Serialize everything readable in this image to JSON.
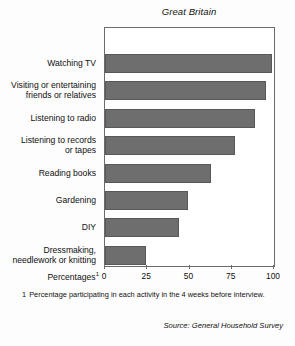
{
  "chart_data": {
    "type": "bar",
    "orientation": "horizontal",
    "title": "Great Britain",
    "xlabel": "Percentages",
    "xlabel_footnote_marker": "1",
    "ylabel": "",
    "categories": [
      "Watching TV",
      "Visiting or entertaining friends or relatives",
      "Listening to radio",
      "Listening to records or tapes",
      "Reading books",
      "Gardening",
      "DIY",
      "Dressmaking, needlework or knitting"
    ],
    "values": [
      99,
      95,
      89,
      77,
      63,
      49,
      44,
      24
    ],
    "xlim": [
      0,
      100
    ],
    "xticks": [
      0,
      25,
      50,
      75,
      100
    ],
    "xtick_labels": [
      "0",
      "25",
      "50",
      "75",
      "100"
    ],
    "grid": false,
    "legend": false,
    "bar_color": "#6e6e6e",
    "bar_border_color": "#585858",
    "frame_color": "#6b6b6b"
  },
  "category_label_lines": [
    [
      "Watching TV"
    ],
    [
      "Visiting or entertaining",
      "friends or relatives"
    ],
    [
      "Listening to radio"
    ],
    [
      "Listening to records",
      "or tapes"
    ],
    [
      "Reading books"
    ],
    [
      "Gardening"
    ],
    [
      "DIY"
    ],
    [
      "Dressmaking,",
      "needlework or knitting"
    ]
  ],
  "footnote": {
    "marker": "1",
    "text": "Percentage participating in each activity in the 4 weeks before interview."
  },
  "source": {
    "text": "Source: General Household Survey"
  }
}
